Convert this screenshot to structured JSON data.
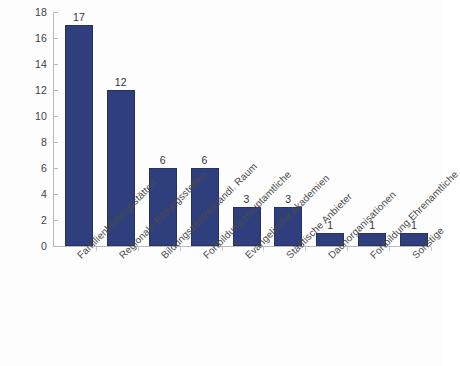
{
  "chart_data": {
    "type": "bar",
    "title": "",
    "subtitle": "",
    "xlabel": "",
    "ylabel": "",
    "ylim": [
      0,
      18
    ],
    "grid": false,
    "legend": false,
    "bar_color": "#2f3f7d",
    "bar_border_color": "#26325f",
    "axis_color": "#b9b9b9",
    "yticks": [
      0,
      2,
      4,
      6,
      8,
      10,
      12,
      14,
      16,
      18
    ],
    "ytick_labels": [
      "0",
      "2",
      "4",
      "6",
      "8",
      "10",
      "12",
      "14",
      "16",
      "18"
    ],
    "categories": [
      "Familienbildungsstätten",
      "Regionale Bildungsstellen",
      "Bildungszentren ländl. Raum",
      "Fortbildung Hauptamtliche",
      "Evangelische Akademien",
      "Städtische Anbieter",
      "Dachorganisationen",
      "Fortbildung Ehrenamtliche",
      "Sonstige"
    ],
    "values": [
      17,
      12,
      6,
      6,
      3,
      3,
      1,
      1,
      1
    ],
    "value_labels": [
      "17",
      "12",
      "6",
      "6",
      "3",
      "3",
      "1",
      "1",
      "1"
    ]
  }
}
